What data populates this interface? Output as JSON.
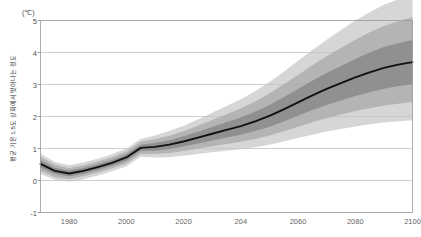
{
  "chart_data": {
    "type": "line",
    "title": "",
    "subtitle": "",
    "xlabel": "",
    "ylabel": "평균 기온 1.5도 상회에서 벗어나는 정도",
    "yunit": "(℃)",
    "xlim": [
      1970,
      2100
    ],
    "ylim": [
      -1,
      5
    ],
    "grid": "horizontal",
    "legend": "none",
    "x_ticks": [
      "1980",
      "2000",
      "2020",
      "204",
      "2060",
      "2080",
      "2100"
    ],
    "x_tick_values": [
      1980,
      2000,
      2020,
      2040,
      2060,
      2080,
      2100
    ],
    "y_ticks": [
      "5",
      "4",
      "3",
      "2",
      "1",
      "0",
      "-1"
    ],
    "y_tick_values": [
      5,
      4,
      3,
      2,
      1,
      0,
      -1
    ],
    "x": [
      1970,
      1975,
      1980,
      1985,
      1990,
      1995,
      2000,
      2005,
      2010,
      2015,
      2020,
      2025,
      2030,
      2035,
      2040,
      2045,
      2050,
      2055,
      2060,
      2065,
      2070,
      2075,
      2080,
      2085,
      2090,
      2095,
      2100
    ],
    "series": [
      {
        "name": "median",
        "color": "#111111",
        "values": [
          0.52,
          0.3,
          0.22,
          0.3,
          0.42,
          0.55,
          0.72,
          1.02,
          1.05,
          1.12,
          1.22,
          1.34,
          1.46,
          1.58,
          1.7,
          1.85,
          2.02,
          2.22,
          2.44,
          2.66,
          2.86,
          3.04,
          3.22,
          3.38,
          3.52,
          3.62,
          3.7
        ]
      }
    ],
    "bands": [
      {
        "name": "inner-band",
        "color": "#8a8a8a",
        "opacity": 0.85,
        "lower": [
          0.4,
          0.2,
          0.13,
          0.21,
          0.33,
          0.46,
          0.62,
          0.92,
          0.93,
          0.98,
          1.06,
          1.16,
          1.25,
          1.34,
          1.43,
          1.55,
          1.68,
          1.84,
          2.02,
          2.2,
          2.36,
          2.5,
          2.64,
          2.76,
          2.87,
          2.95,
          3.01
        ],
        "upper": [
          0.64,
          0.4,
          0.31,
          0.39,
          0.51,
          0.64,
          0.82,
          1.12,
          1.17,
          1.26,
          1.38,
          1.52,
          1.67,
          1.82,
          1.97,
          2.15,
          2.36,
          2.6,
          2.86,
          3.12,
          3.36,
          3.58,
          3.8,
          4.0,
          4.17,
          4.29,
          4.39
        ]
      },
      {
        "name": "middle-band",
        "color": "#a8a8a8",
        "opacity": 0.75,
        "lower": [
          0.3,
          0.11,
          0.05,
          0.13,
          0.25,
          0.38,
          0.53,
          0.83,
          0.83,
          0.86,
          0.92,
          1.0,
          1.07,
          1.14,
          1.21,
          1.3,
          1.41,
          1.54,
          1.68,
          1.82,
          1.95,
          2.06,
          2.17,
          2.26,
          2.34,
          2.4,
          2.45
        ],
        "upper": [
          0.74,
          0.49,
          0.39,
          0.47,
          0.59,
          0.73,
          0.91,
          1.21,
          1.29,
          1.4,
          1.54,
          1.71,
          1.89,
          2.07,
          2.25,
          2.47,
          2.72,
          3.0,
          3.3,
          3.6,
          3.88,
          4.14,
          4.4,
          4.63,
          4.83,
          4.98,
          5.1
        ]
      },
      {
        "name": "outer-band",
        "color": "#c4c4c4",
        "opacity": 0.7,
        "lower": [
          0.2,
          0.02,
          -0.04,
          0.04,
          0.16,
          0.29,
          0.44,
          0.74,
          0.72,
          0.73,
          0.77,
          0.83,
          0.88,
          0.93,
          0.98,
          1.04,
          1.12,
          1.22,
          1.33,
          1.43,
          1.53,
          1.61,
          1.69,
          1.76,
          1.81,
          1.85,
          1.88
        ],
        "upper": [
          0.84,
          0.58,
          0.48,
          0.56,
          0.68,
          0.82,
          1.0,
          1.3,
          1.41,
          1.55,
          1.71,
          1.91,
          2.12,
          2.33,
          2.54,
          2.79,
          3.08,
          3.4,
          3.74,
          4.08,
          4.4,
          4.7,
          5.0,
          5.26,
          5.49,
          5.66,
          5.8
        ]
      }
    ]
  }
}
